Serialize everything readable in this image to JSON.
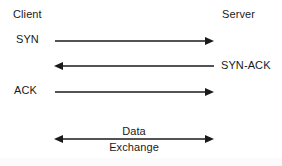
{
  "diagram": {
    "participants": {
      "left": "Client",
      "right": "Server"
    },
    "messages": [
      {
        "label": "SYN",
        "direction": "left-to-right",
        "label_side": "left",
        "arrowheads": "end"
      },
      {
        "label": "SYN-ACK",
        "direction": "right-to-left",
        "label_side": "right",
        "arrowheads": "start"
      },
      {
        "label": "ACK",
        "direction": "left-to-right",
        "label_side": "left",
        "arrowheads": "end"
      },
      {
        "label_top": "Data",
        "label_bottom": "Exchange",
        "direction": "bidirectional",
        "label_side": "center",
        "arrowheads": "both"
      }
    ],
    "colors": {
      "ink": "#1a1a1a",
      "background": "#ffffff"
    }
  }
}
